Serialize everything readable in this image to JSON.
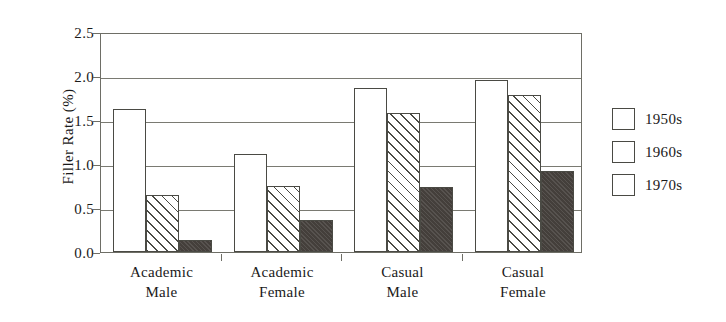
{
  "chart_data": {
    "type": "bar",
    "title": "",
    "xlabel": "",
    "ylabel": "Filler Rate (%)",
    "ylim": [
      0.0,
      2.5
    ],
    "ytick_values": [
      0.0,
      0.5,
      1.0,
      1.5,
      2.0,
      2.5
    ],
    "ytick_labels": [
      "0.0",
      "0.5",
      "1.0",
      "1.5",
      "2.0",
      "2.5"
    ],
    "grid": "horizontal",
    "legend_position": "right",
    "categories": [
      {
        "line1": "Academic",
        "line2": "Male"
      },
      {
        "line1": "Academic",
        "line2": "Female"
      },
      {
        "line1": "Casual",
        "line2": "Male"
      },
      {
        "line1": "Casual",
        "line2": "Female"
      }
    ],
    "series": [
      {
        "name": "1950s",
        "fill": "white",
        "color": "#ffffff",
        "values": [
          1.63,
          1.11,
          1.86,
          1.96
        ]
      },
      {
        "name": "1960s",
        "fill": "diagonal-hatch",
        "color": "#ffffff",
        "values": [
          0.65,
          0.75,
          1.58,
          1.78
        ]
      },
      {
        "name": "1970s",
        "fill": "solid-dark",
        "color": "#443f3b",
        "values": [
          0.14,
          0.36,
          0.74,
          0.92
        ]
      }
    ]
  },
  "axis": {
    "frame_color": "#6e6e66"
  }
}
